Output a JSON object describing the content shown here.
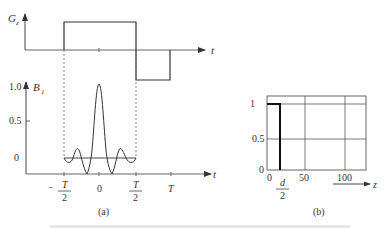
{
  "figure": {
    "panel_a": {
      "caption": "(a)",
      "gz_plot": {
        "y_label": "G",
        "y_label_sub": "z",
        "x_label": "t",
        "shape": "positive slice-select lobe from -T/2 to T/2, negative rephasing lobe from T/2 to T"
      },
      "b1_plot": {
        "y_label": "B",
        "y_label_sub": "1",
        "x_label": "t",
        "y_ticks": [
          "1.0",
          "0.5",
          "0"
        ],
        "x_ticks": [
          {
            "num": "T",
            "den": "2",
            "sign": "−"
          },
          {
            "num": "0",
            "den": "",
            "sign": ""
          },
          {
            "num": "T",
            "den": "2",
            "sign": ""
          },
          {
            "num": "T",
            "den": "",
            "sign": ""
          }
        ],
        "shape": "truncated sinc pulse, peak 1.0 at t=0, two side lobes each side"
      }
    },
    "panel_b": {
      "caption": "(b)",
      "x_label": "z",
      "y_ticks": [
        "1",
        "0.5",
        "0"
      ],
      "x_ticks": [
        "0",
        "50",
        "100"
      ],
      "d_label_num": "d",
      "d_label_den": "2",
      "shape": "rectangular slice profile, 1 from z=0 to d/2 then 0"
    }
  }
}
